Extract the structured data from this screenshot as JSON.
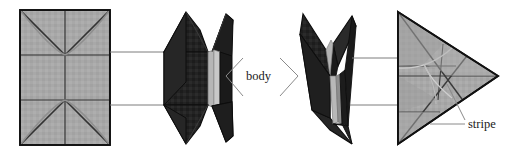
{
  "figure": {
    "type": "origami-folding-diagram",
    "background_color": "#ffffff",
    "width": 519,
    "height": 155,
    "labels": [
      {
        "id": "body",
        "text": "body",
        "x": 246,
        "y": 80
      },
      {
        "id": "stripe",
        "text": "stripe",
        "x": 468,
        "y": 128
      }
    ],
    "colors": {
      "paper_gray": "#a8a8a8",
      "paper_gray_shade": "#9d9d9d",
      "paper_gray_light": "#b4b4b4",
      "dark_fold": "#232323",
      "dark_fold_shade": "#2e2e2e",
      "stripe_gray": "#b0b0b0",
      "stripe_gray_light": "#c6c6c6",
      "outline": "#111111",
      "crease": "#3a3a3a",
      "leader_line": "#8a8a8a"
    },
    "panels": [
      {
        "id": "panel-1",
        "name": "unfolded-rectangle-crease-pattern",
        "shape": "rectangle",
        "bounds": {
          "x": 20,
          "y": 10,
          "width": 90,
          "height": 135
        },
        "description": "Flat square sheet showing crease pattern with diagonals and arcs"
      },
      {
        "id": "panel-2",
        "name": "folded-dark-body-front",
        "shape": "star-like-folded-form",
        "bounds": {
          "x": 163,
          "y": 10,
          "width": 80,
          "height": 135
        },
        "description": "Dark folded model seen flat with vertical light stripe at center"
      },
      {
        "id": "panel-3",
        "name": "folded-dark-body-side",
        "shape": "arrow-like-folded-form",
        "bounds": {
          "x": 300,
          "y": 10,
          "width": 66,
          "height": 135
        },
        "description": "Dark folded model seen edge-on with narrow light stripe"
      },
      {
        "id": "panel-4",
        "name": "folded-gray-triangle",
        "shape": "triangle",
        "bounds": {
          "x": 398,
          "y": 10,
          "width": 100,
          "height": 135
        },
        "description": "Gray triangular folded form with interior crease lines"
      }
    ],
    "connectors": [
      {
        "id": "c1",
        "from": "panel-1",
        "to": "panel-2",
        "x1": 110,
        "y1": 52,
        "x2": 163,
        "y2": 52
      },
      {
        "id": "c2",
        "from": "panel-1",
        "to": "panel-2",
        "x1": 110,
        "y1": 105,
        "x2": 163,
        "y2": 105
      },
      {
        "id": "c3",
        "from": "panel-3",
        "to": "panel-4",
        "x1": 352,
        "y1": 58,
        "x2": 412,
        "y2": 58
      },
      {
        "id": "c4",
        "from": "panel-3",
        "to": "panel-4",
        "x1": 352,
        "y1": 105,
        "x2": 412,
        "y2": 105
      }
    ],
    "leaders": [
      {
        "id": "body-left",
        "label": "body",
        "points": "243,58 226,76 243,96"
      },
      {
        "id": "body-right",
        "label": "body",
        "points": "278,58 296,76 278,96"
      },
      {
        "id": "stripe-a",
        "label": "stripe",
        "points": "466,124 430,124"
      },
      {
        "id": "stripe-b",
        "label": "stripe",
        "points": "466,121 447,84"
      }
    ]
  }
}
